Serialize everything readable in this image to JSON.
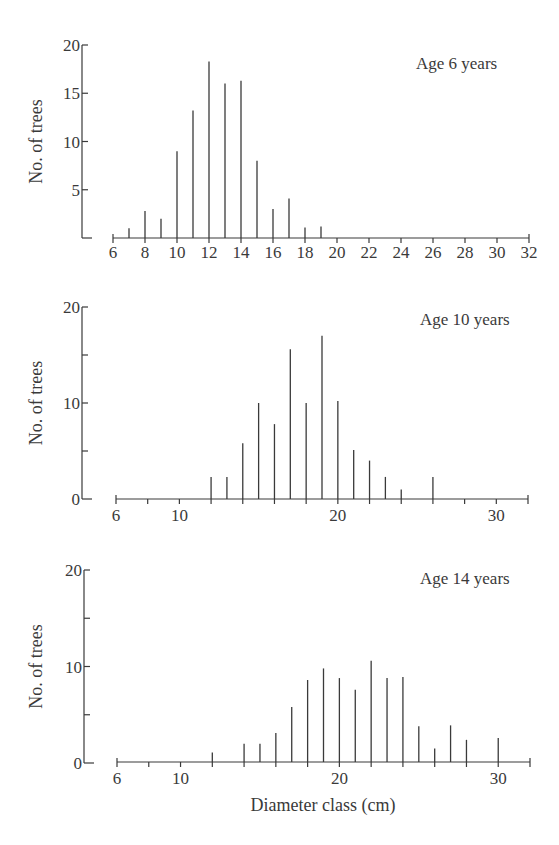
{
  "figure": {
    "ylabel": "No. of trees",
    "xlabel": "Diameter class (cm)"
  },
  "chart_data": [
    {
      "type": "bar",
      "title": "Age 6 years",
      "xlabel": "",
      "ylabel": "No. of trees",
      "x_range": [
        6,
        32
      ],
      "ylim": [
        0,
        20
      ],
      "y_ticks": [
        5,
        10,
        15,
        20
      ],
      "y_tick_labels": [
        "5",
        "10",
        "15",
        "20"
      ],
      "x_ticks": [
        6,
        8,
        10,
        12,
        14,
        16,
        18,
        20,
        22,
        24,
        26,
        28,
        30,
        32
      ],
      "x_tick_labels": [
        "6",
        "8",
        "10",
        "12",
        "14",
        "16",
        "18",
        "20",
        "22",
        "24",
        "26",
        "28",
        "30",
        "32"
      ],
      "x_minor_ticks": [],
      "grid": false,
      "categories": [
        7,
        8,
        9,
        10,
        11,
        12,
        13,
        14,
        15,
        16,
        17,
        18,
        19
      ],
      "values": [
        1,
        2.8,
        2,
        9,
        13.2,
        18.3,
        16,
        16.3,
        8,
        3,
        4.1,
        1.1,
        1.2
      ]
    },
    {
      "type": "bar",
      "title": "Age 10 years",
      "xlabel": "",
      "ylabel": "No. of trees",
      "x_range": [
        6,
        32
      ],
      "ylim": [
        0,
        20
      ],
      "y_ticks": [
        0,
        5,
        10,
        15,
        20
      ],
      "y_tick_labels": [
        "0",
        "",
        "10",
        "",
        "20"
      ],
      "x_ticks": [
        6,
        8,
        10,
        12,
        14,
        16,
        18,
        20,
        22,
        24,
        26,
        28,
        30,
        32
      ],
      "x_tick_labels": [
        "6",
        "",
        "10",
        "",
        "",
        "",
        "",
        "20",
        "",
        "",
        "",
        "",
        "30",
        ""
      ],
      "grid": false,
      "categories": [
        12,
        13,
        14,
        15,
        16,
        17,
        18,
        19,
        20,
        21,
        22,
        23,
        24,
        26
      ],
      "values": [
        2.3,
        2.3,
        5.8,
        10,
        7.8,
        15.6,
        10,
        17,
        10.2,
        5.1,
        4,
        2.3,
        1,
        2.3
      ]
    },
    {
      "type": "bar",
      "title": "Age 14 years",
      "xlabel": "Diameter class (cm)",
      "ylabel": "No. of trees",
      "x_range": [
        6,
        32
      ],
      "ylim": [
        0,
        20
      ],
      "y_ticks": [
        0,
        5,
        10,
        15,
        20
      ],
      "y_tick_labels": [
        "0",
        "",
        "10",
        "",
        "20"
      ],
      "x_ticks": [
        6,
        8,
        10,
        12,
        14,
        16,
        18,
        20,
        22,
        24,
        26,
        28,
        30,
        32
      ],
      "x_tick_labels": [
        "6",
        "",
        "10",
        "",
        "",
        "",
        "",
        "20",
        "",
        "",
        "",
        "",
        "30",
        ""
      ],
      "grid": false,
      "categories": [
        12,
        14,
        15,
        16,
        17,
        18,
        19,
        20,
        21,
        22,
        23,
        24,
        25,
        26,
        27,
        28,
        30
      ],
      "values": [
        1.1,
        2,
        2,
        3.1,
        5.8,
        8.6,
        9.8,
        8.8,
        7.6,
        10.6,
        8.8,
        8.9,
        3.8,
        1.5,
        3.9,
        2.4,
        2.6
      ]
    }
  ]
}
